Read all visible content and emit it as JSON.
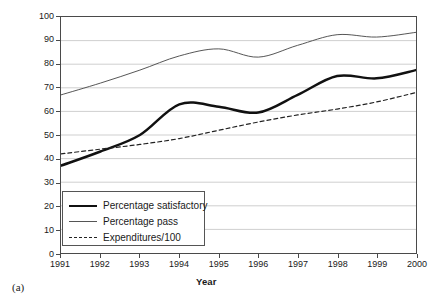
{
  "caption": "(a)",
  "axes": {
    "ylabel": "Percentage/dollars",
    "xlabel": "Year",
    "yticks": [
      "0",
      "10",
      "20",
      "30",
      "40",
      "50",
      "60",
      "70",
      "80",
      "90",
      "100"
    ],
    "xticks": [
      "1991",
      "1992",
      "1993",
      "1994",
      "1995",
      "1996",
      "1997",
      "1998",
      "1999",
      "2000"
    ]
  },
  "legend": {
    "items": [
      {
        "label": "Percentage satisfactory",
        "style": "thick-solid",
        "color": "#111111"
      },
      {
        "label": "Percentage pass",
        "style": "thin-solid",
        "color": "#555555"
      },
      {
        "label": "Expenditures/100",
        "style": "dashed",
        "color": "#222222"
      }
    ]
  },
  "chart_data": {
    "type": "line",
    "title": "",
    "xlabel": "Year",
    "ylabel": "Percentage/dollars",
    "xlim": [
      1991,
      2000
    ],
    "ylim": [
      0,
      100
    ],
    "ytick_step": 10,
    "grid": "horizontal",
    "legend_position": "inside lower-left",
    "x": [
      1991,
      1992,
      1993,
      1994,
      1995,
      1996,
      1997,
      1998,
      1999,
      2000
    ],
    "series": [
      {
        "name": "Percentage satisfactory",
        "color": "#111111",
        "style": "thick-solid",
        "values": [
          37,
          43,
          50,
          63,
          62,
          59.5,
          67,
          75,
          74,
          77.5
        ]
      },
      {
        "name": "Percentage pass",
        "color": "#555555",
        "style": "thin-solid",
        "values": [
          67,
          72,
          77.5,
          83.5,
          86.5,
          83,
          88,
          92.5,
          91.5,
          93.5
        ]
      },
      {
        "name": "Expenditures/100",
        "color": "#222222",
        "style": "dashed",
        "values": [
          42,
          44,
          46,
          48.5,
          52,
          55.5,
          58.5,
          61,
          64,
          68
        ]
      }
    ]
  }
}
